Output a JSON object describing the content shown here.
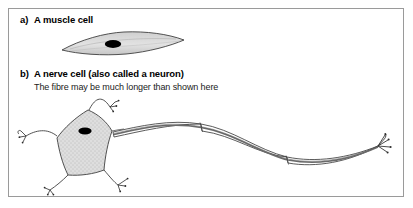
{
  "figure": {
    "panels": [
      {
        "marker": "a)",
        "title": "A muscle cell",
        "subtitle": "",
        "illustration": "muscle-cell"
      },
      {
        "marker": "b)",
        "title": "A nerve cell (also called a neuron)",
        "subtitle": "The fibre may be much longer than shown here",
        "illustration": "nerve-cell"
      }
    ],
    "parts": {
      "muscle_cell_nucleus": "nucleus",
      "muscle_cell_body": "spindle-shaped muscle fibre",
      "neuron_cell_body": "cell body",
      "neuron_nucleus": "nucleus",
      "neuron_dendrites": "dendrites",
      "neuron_axon": "axon fibre",
      "neuron_myelin_segments": "myelin sheath segments",
      "neuron_terminals": "axon terminals"
    },
    "colors": {
      "frame_border": "#9a9a9a",
      "ink": "#000000",
      "outline": "#4a4a4a",
      "cell_fill": "#d9d9d9",
      "nucleus": "#000000",
      "background": "#ffffff"
    }
  }
}
